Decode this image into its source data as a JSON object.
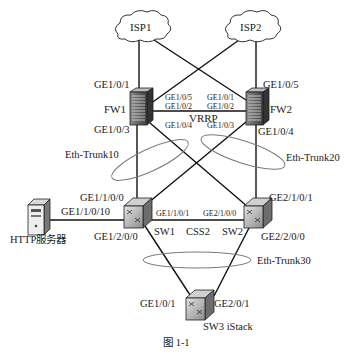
{
  "caption": "图 1-1",
  "colors": {
    "line": "#111111",
    "ellipse": "#777777",
    "device_dark": "#555555",
    "device_light": "#cfcfcf",
    "background": "#ffffff"
  },
  "nodes": {
    "isp1": {
      "label": "ISP1",
      "icon": "cloud-icon"
    },
    "isp2": {
      "label": "ISP2",
      "icon": "cloud-icon"
    },
    "fw1": {
      "label": "FW1",
      "icon": "firewall-icon"
    },
    "fw2": {
      "label": "FW2",
      "icon": "firewall-icon"
    },
    "sw1": {
      "label": "SW1",
      "icon": "switch-icon"
    },
    "sw2": {
      "label": "SW2",
      "icon": "switch-icon"
    },
    "sw3": {
      "label": "SW3 iStack",
      "icon": "switch-icon"
    },
    "server": {
      "label": "HTTP服务器",
      "icon": "server-icon"
    }
  },
  "ports": {
    "fw1_up": "GE1/0/1",
    "fw2_up": "GE1/0/5",
    "fw1_p5": "GE1/0/5",
    "fw1_p2": "GE1/0/2",
    "fw2_p1": "GE1/0/1",
    "fw2_p2": "GE1/0/2",
    "fw1_down": "GE1/0/3",
    "fw1_cross": "GE1/0/4",
    "fw2_cross": "GE1/0/3",
    "fw2_down": "GE1/0/4",
    "sw1_up": "GE1/1/0/0",
    "sw1_server": "GE1/1/0/10",
    "sw1_css": "GE1/1/0/1",
    "sw2_css": "GE2/1/0/0",
    "sw2_up": "GE2/1/0/1",
    "sw1_down": "GE1/2/0/0",
    "sw2_down": "GE2/2/0/0",
    "sw3_left": "GE1/0/1",
    "sw3_right": "GE2/0/1"
  },
  "links": {
    "vrrp": "VRRP",
    "css": "CSS2",
    "trunk10": "Eth-Trunk10",
    "trunk20": "Eth-Trunk20",
    "trunk30": "Eth-Trunk30"
  }
}
